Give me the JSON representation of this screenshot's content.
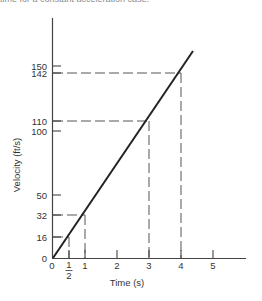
{
  "caption": "time for a constant acceleration case.",
  "chart_data": {
    "type": "line",
    "title": "",
    "xlabel": "Time (s)",
    "ylabel": "Velocity (ft/s)",
    "xlim": [
      0,
      5.5
    ],
    "ylim": [
      0,
      160
    ],
    "x_ticks": [
      {
        "value": 0,
        "label": "0"
      },
      {
        "value": 0.5,
        "label": "1/2"
      },
      {
        "value": 1,
        "label": "1"
      },
      {
        "value": 2,
        "label": "2"
      },
      {
        "value": 3,
        "label": "3"
      },
      {
        "value": 4,
        "label": "4"
      },
      {
        "value": 5,
        "label": "5"
      }
    ],
    "y_ticks": [
      {
        "value": 0,
        "label": "0"
      },
      {
        "value": 16,
        "label": "16"
      },
      {
        "value": 32,
        "label": "32"
      },
      {
        "value": 50,
        "label": "50"
      },
      {
        "value": 100,
        "label": "100"
      },
      {
        "value": 110,
        "label": "110"
      },
      {
        "value": 142,
        "label": "142"
      },
      {
        "value": 150,
        "label": "150"
      }
    ],
    "series": [
      {
        "name": "velocity",
        "x": [
          0,
          4.4
        ],
        "y": [
          0,
          161
        ],
        "style": "solid"
      }
    ],
    "reference_points": [
      {
        "t": 0.5,
        "v": 16
      },
      {
        "t": 1,
        "v": 32
      },
      {
        "t": 3,
        "v": 110
      },
      {
        "t": 4,
        "v": 142
      }
    ],
    "grid": false,
    "legend": null
  },
  "axis": {
    "x_title": "Time (s)",
    "y_title": "Velocity (ft/s)",
    "origin_label": "0"
  }
}
